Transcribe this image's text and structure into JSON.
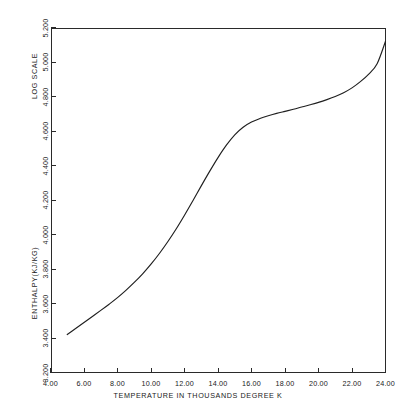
{
  "chart_data": {
    "type": "line",
    "title": "",
    "xlabel": "TEMPERATURE IN THOUSANDS DEGREE K",
    "ylabel": "ENTHALPY(KJ/KG)",
    "ylabel_secondary": "LOG SCALE",
    "xlim": [
      4.0,
      24.0
    ],
    "ylim": [
      3.2,
      5.2
    ],
    "grid": false,
    "legend": null,
    "xticks": [
      "4.00",
      "6.00",
      "8.00",
      "10.00",
      "12.00",
      "14.00",
      "16.00",
      "18.00",
      "20.00",
      "22.00",
      "24.00"
    ],
    "xtick_values": [
      4,
      6,
      8,
      10,
      12,
      14,
      16,
      18,
      20,
      22,
      24
    ],
    "yticks": [
      "3.200",
      "3.400",
      "3.600",
      "3.800",
      "4.000",
      "4.200",
      "4.400",
      "4.600",
      "4.800",
      "5.000",
      "5.200"
    ],
    "ytick_values": [
      3.2,
      3.4,
      3.6,
      3.8,
      4.0,
      4.2,
      4.4,
      4.6,
      4.8,
      5.0,
      5.2
    ],
    "series": [
      {
        "name": "enthalpy",
        "color": "#1f1f1f",
        "x": [
          5.0,
          5.5,
          6.0,
          6.5,
          7.0,
          7.5,
          8.0,
          8.5,
          9.0,
          9.5,
          10.0,
          10.5,
          11.0,
          11.5,
          12.0,
          12.5,
          13.0,
          13.5,
          14.0,
          14.5,
          15.0,
          15.5,
          16.0,
          16.5,
          17.0,
          17.5,
          18.0,
          18.5,
          19.0,
          19.5,
          20.0,
          20.5,
          21.0,
          21.5,
          22.0,
          22.5,
          23.0,
          23.5,
          24.0
        ],
        "y": [
          3.42,
          3.455,
          3.49,
          3.525,
          3.56,
          3.596,
          3.634,
          3.676,
          3.722,
          3.772,
          3.828,
          3.89,
          3.958,
          4.032,
          4.112,
          4.196,
          4.282,
          4.366,
          4.446,
          4.518,
          4.578,
          4.622,
          4.652,
          4.672,
          4.688,
          4.702,
          4.714,
          4.726,
          4.739,
          4.752,
          4.766,
          4.782,
          4.8,
          4.822,
          4.85,
          4.886,
          4.93,
          4.99,
          5.12
        ]
      }
    ]
  },
  "axes": {
    "x_title": "TEMPERATURE IN THOUSANDS DEGREE K",
    "y_title_lower": "ENTHALPY(KJ/KG)",
    "y_title_upper": "LOG SCALE"
  },
  "caption": {
    "text": ""
  }
}
